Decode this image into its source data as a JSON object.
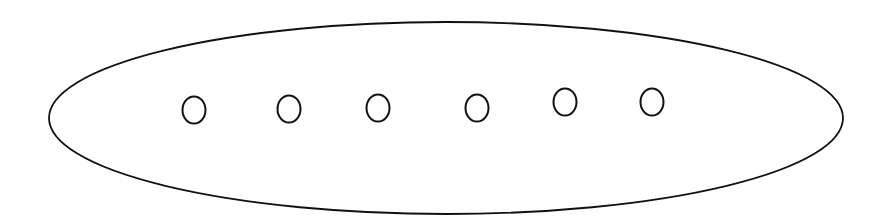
{
  "diagram": {
    "type": "set-with-elements",
    "background": "#ffffff",
    "stroke_color": "#111111",
    "container": {
      "shape": "ellipse",
      "cx": 446,
      "cy": 118,
      "rx": 397,
      "ry": 96,
      "stroke_width": 1.8
    },
    "elements": [
      {
        "shape": "ellipse",
        "cx": 194,
        "cy": 110,
        "rx": 11.5,
        "ry": 13.5
      },
      {
        "shape": "ellipse",
        "cx": 289,
        "cy": 109,
        "rx": 11.5,
        "ry": 13.5
      },
      {
        "shape": "ellipse",
        "cx": 378,
        "cy": 108,
        "rx": 11.5,
        "ry": 13.5
      },
      {
        "shape": "ellipse",
        "cx": 477,
        "cy": 108,
        "rx": 11.5,
        "ry": 13.5
      },
      {
        "shape": "ellipse",
        "cx": 565,
        "cy": 102,
        "rx": 11.5,
        "ry": 13.5
      },
      {
        "shape": "ellipse",
        "cx": 652,
        "cy": 102,
        "rx": 11.5,
        "ry": 13.5
      }
    ],
    "element_stroke_width": 2
  }
}
